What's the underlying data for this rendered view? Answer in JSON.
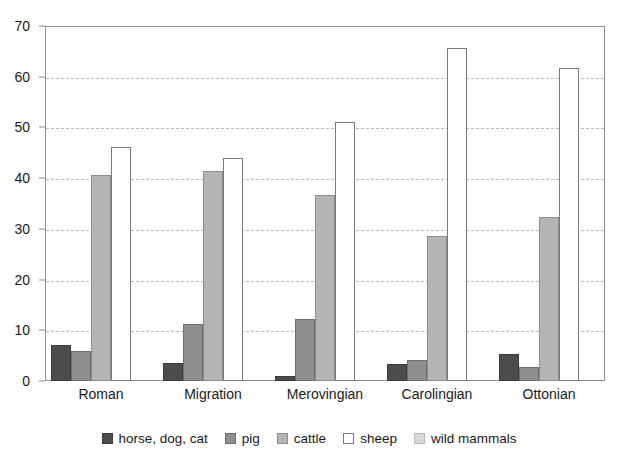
{
  "chart_data": {
    "type": "bar",
    "title": "",
    "subtitle": "",
    "xlabel": "",
    "ylabel": "",
    "categories": [
      "Roman",
      "Migration",
      "Merovingian",
      "Carolingian",
      "Ottonian"
    ],
    "series": [
      {
        "name": "horse, dog, cat",
        "color": "#4c4c4c",
        "values": [
          7.2,
          3.6,
          1.0,
          3.4,
          5.4
        ]
      },
      {
        "name": "pig",
        "color": "#8f8f8f",
        "values": [
          5.9,
          11.2,
          12.3,
          4.2,
          2.8
        ]
      },
      {
        "name": "cattle",
        "color": "#b5b5b5",
        "values": [
          40.7,
          41.4,
          36.6,
          28.6,
          32.3
        ]
      },
      {
        "name": "sheep",
        "color": "#ffffff",
        "values": [
          46.2,
          44.0,
          51.0,
          65.6,
          61.8
        ]
      },
      {
        "name": "wild mammals",
        "color": "#d8d8d8",
        "values": [
          0.0,
          0.0,
          0.0,
          0.0,
          0.0
        ]
      }
    ],
    "ylim": [
      0,
      70
    ],
    "y_ticks": [
      0,
      10,
      20,
      30,
      40,
      50,
      60,
      70
    ],
    "y_tick_labels": [
      "0",
      "10",
      "20",
      "30",
      "40",
      "50",
      "60",
      "70"
    ],
    "grid": true,
    "grid_axis": "y",
    "grid_style": "dashed",
    "legend_position": "bottom",
    "legend_entries": [
      "horse, dog, cat",
      "pig",
      "cattle",
      "sheep",
      "wild mammals"
    ]
  },
  "colors": {
    "background": "#ffffff",
    "axis": "#8e8e8e",
    "gridline": "#b9b9b9",
    "text": "#1a1a1a"
  }
}
